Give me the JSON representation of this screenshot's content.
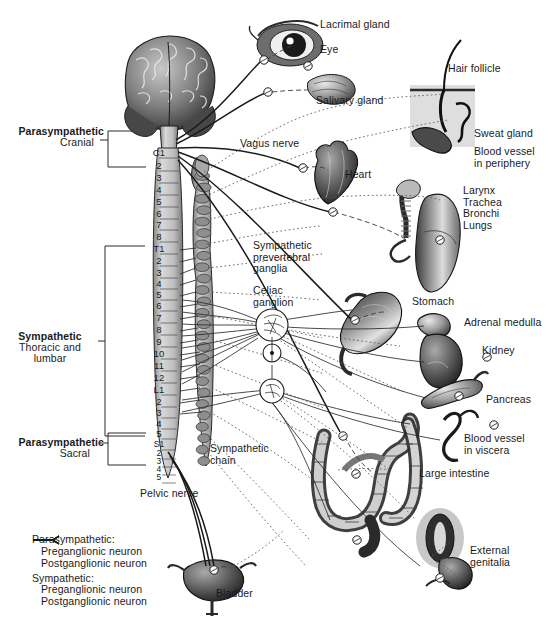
{
  "figure": {
    "background": "#ffffff",
    "ink": "#1a1a1a"
  },
  "divisions": [
    {
      "name": "parasympathetic-cranial",
      "line1": "Parasympathetic",
      "line2": "Cranial",
      "x": 8,
      "y": 126,
      "bracket": {
        "x": 108,
        "y": 131,
        "w": 38,
        "h": 36
      }
    },
    {
      "name": "sympathetic-thoracolumbar",
      "line1": "Sympathetic",
      "line2": "Thoracic and",
      "line3": "lumbar",
      "x": 22,
      "y": 331,
      "bracket": {
        "x": 105,
        "y": 246,
        "w": 40,
        "h": 190
      }
    },
    {
      "name": "parasympathetic-sacral",
      "line1": "Parasympathetic",
      "line2": "Sacral",
      "x": 8,
      "y": 437,
      "bracket": {
        "x": 108,
        "y": 433,
        "w": 38,
        "h": 32
      }
    }
  ],
  "spinal_cord": {
    "label": "vertebral-segments",
    "x": 148,
    "y_start": 152,
    "segments": [
      {
        "id": "C1",
        "text": "C1",
        "y": 152
      },
      {
        "id": "C2",
        "text": "2",
        "y": 165
      },
      {
        "id": "C3",
        "text": "3",
        "y": 177
      },
      {
        "id": "C4",
        "text": "4",
        "y": 189
      },
      {
        "id": "C5",
        "text": "5",
        "y": 201
      },
      {
        "id": "C6",
        "text": "6",
        "y": 213
      },
      {
        "id": "C7",
        "text": "7",
        "y": 224
      },
      {
        "id": "C8",
        "text": "8",
        "y": 236
      },
      {
        "id": "T1",
        "text": "T1",
        "y": 248
      },
      {
        "id": "T2",
        "text": "2",
        "y": 260
      },
      {
        "id": "T3",
        "text": "3",
        "y": 272
      },
      {
        "id": "T4",
        "text": "4",
        "y": 283
      },
      {
        "id": "T5",
        "text": "5",
        "y": 294
      },
      {
        "id": "T6",
        "text": "6",
        "y": 305
      },
      {
        "id": "T7",
        "text": "7",
        "y": 317
      },
      {
        "id": "T8",
        "text": "8",
        "y": 329
      },
      {
        "id": "T9",
        "text": "9",
        "y": 341
      },
      {
        "id": "T10",
        "text": "10",
        "y": 353
      },
      {
        "id": "T11",
        "text": "11",
        "y": 365
      },
      {
        "id": "T12",
        "text": "12",
        "y": 377
      },
      {
        "id": "L1",
        "text": "L1",
        "y": 389
      },
      {
        "id": "L2",
        "text": "2",
        "y": 401
      },
      {
        "id": "L3",
        "text": "3",
        "y": 412
      },
      {
        "id": "L4",
        "text": "4",
        "y": 423
      },
      {
        "id": "L5",
        "text": "5",
        "y": 433
      },
      {
        "id": "S1",
        "text": "S1",
        "y": 444
      },
      {
        "id": "S2",
        "text": "2",
        "y": 453
      },
      {
        "id": "S3",
        "text": "3",
        "y": 461
      },
      {
        "id": "S4",
        "text": "4",
        "y": 469
      },
      {
        "id": "S5",
        "text": "5",
        "y": 477
      }
    ]
  },
  "structure_labels": [
    {
      "name": "vagus-nerve",
      "text": "Vagus nerve",
      "x": 240,
      "y": 143
    },
    {
      "name": "sympathetic-prevertebral-ganglia",
      "text": "Sympathetic\nprevertebral\nganglia",
      "x": 253,
      "y": 242
    },
    {
      "name": "celiac-ganglion",
      "text": "Celiac\nganglion",
      "x": 253,
      "y": 285
    },
    {
      "name": "sympathetic-chain",
      "text": "Sympathetic\nchain",
      "x": 210,
      "y": 443
    },
    {
      "name": "pelvic-nerve",
      "text": "Pelvic nerve",
      "x": 140,
      "y": 490
    }
  ],
  "organ_labels": [
    {
      "name": "lacrimal-gland",
      "text": "Lacrimal gland",
      "x": 320,
      "y": 23
    },
    {
      "name": "eye",
      "text": "Eye",
      "x": 320,
      "y": 48
    },
    {
      "name": "salivary-gland",
      "text": "Salivary gland",
      "x": 316,
      "y": 96
    },
    {
      "name": "hair-follicle",
      "text": "Hair follicle",
      "x": 450,
      "y": 66
    },
    {
      "name": "sweat-gland",
      "text": "Sweat gland",
      "x": 474,
      "y": 131
    },
    {
      "name": "blood-vessel-periphery",
      "text": "Blood vessel\nin periphery",
      "x": 474,
      "y": 148
    },
    {
      "name": "heart",
      "text": "Heart",
      "x": 345,
      "y": 172
    },
    {
      "name": "larynx-trachea-bronchi-lungs",
      "text": "Larynx\nTrachea\nBronchi\nLungs",
      "x": 463,
      "y": 188
    },
    {
      "name": "stomach",
      "text": "Stomach",
      "x": 413,
      "y": 298
    },
    {
      "name": "adrenal-medulla",
      "text": "Adrenal medulla",
      "x": 466,
      "y": 319
    },
    {
      "name": "kidney",
      "text": "Kidney",
      "x": 483,
      "y": 347
    },
    {
      "name": "pancreas",
      "text": "Pancreas",
      "x": 487,
      "y": 396
    },
    {
      "name": "blood-vessel-viscera",
      "text": "Blood vessel\nin viscera",
      "x": 466,
      "y": 435
    },
    {
      "name": "large-intestine",
      "text": "Large intestine",
      "x": 420,
      "y": 470
    },
    {
      "name": "external-genitalia",
      "text": "External\ngenitalia",
      "x": 471,
      "y": 547
    },
    {
      "name": "bladder",
      "text": "Bladder",
      "x": 217,
      "y": 590
    }
  ],
  "legend": {
    "name": "neuron-type-legend",
    "x": 32,
    "y": 536,
    "groups": [
      {
        "heading": "Parasympathetic:",
        "items": [
          {
            "label": "Preganglionic neuron",
            "style": "solid-thick"
          },
          {
            "label": "Postganglionic neuron",
            "style": "dashed"
          }
        ]
      },
      {
        "heading": "Sympathetic:",
        "items": [
          {
            "label": "Preganglionic neuron",
            "style": "solid-thin"
          },
          {
            "label": "Postganglionic neuron",
            "style": "dotted"
          }
        ]
      }
    ]
  }
}
